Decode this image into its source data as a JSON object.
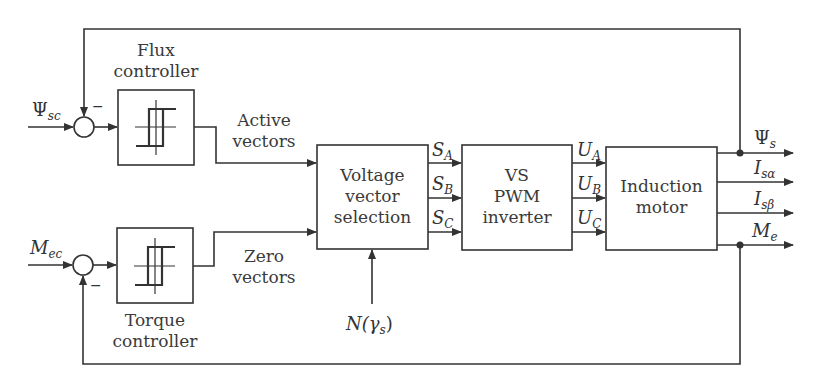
{
  "diagram": {
    "type": "block-diagram",
    "blocks": {
      "flux_controller": {
        "label": "Flux\ncontroller",
        "line1": "Flux",
        "line2": "controller",
        "symbol": "hysteresis"
      },
      "torque_controller": {
        "label": "Torque\ncontroller",
        "line1": "Torque",
        "line2": "controller",
        "symbol": "hysteresis"
      },
      "voltage_vector_selection": {
        "line1": "Voltage",
        "line2": "vector",
        "line3": "selection"
      },
      "inverter": {
        "line1": "VS",
        "line2": "PWM",
        "line3": "inverter"
      },
      "motor": {
        "line1": "Induction",
        "line2": "motor"
      }
    },
    "signals": {
      "flux_ref": {
        "base": "Ψ",
        "sub": "sc"
      },
      "torque_ref": {
        "base": "M",
        "sub": "ec"
      },
      "active_vectors": {
        "line1": "Active",
        "line2": "vectors"
      },
      "zero_vectors": {
        "line1": "Zero",
        "line2": "vectors"
      },
      "sector": {
        "base": "N(γ",
        "sub": "s",
        "close": ")"
      },
      "sa": {
        "base": "S",
        "sub": "A"
      },
      "sb": {
        "base": "S",
        "sub": "B"
      },
      "sc": {
        "base": "S",
        "sub": "C"
      },
      "ua": {
        "base": "U",
        "sub": "A"
      },
      "ub": {
        "base": "U",
        "sub": "B"
      },
      "uc": {
        "base": "U",
        "sub": "C"
      },
      "psi_s": {
        "base": "Ψ",
        "sub": "s"
      },
      "is_alpha": {
        "base": "I",
        "sub": "sα"
      },
      "is_beta": {
        "base": "I",
        "sub": "sβ"
      },
      "me": {
        "base": "M",
        "sub": "e"
      }
    },
    "summing_signs": {
      "flux_minus": "−",
      "torque_minus": "−"
    }
  },
  "colors": {
    "line": "#333333",
    "background": "#ffffff"
  }
}
